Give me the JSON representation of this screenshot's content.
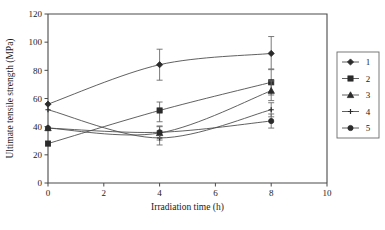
{
  "chart_data": {
    "type": "line",
    "title": "",
    "xlabel": "Irradiation time (h)",
    "ylabel": "Ultimate tensile strength (MPa)",
    "x": [
      0,
      4,
      8
    ],
    "xlim": [
      0,
      10
    ],
    "ylim": [
      0,
      120
    ],
    "xticks": [
      "0",
      "2",
      "4",
      "6",
      "8",
      "10"
    ],
    "xtick_values": [
      0,
      2,
      4,
      6,
      8,
      10
    ],
    "yticks": [
      "0",
      "20",
      "40",
      "60",
      "80",
      "100",
      "120"
    ],
    "ytick_values": [
      0,
      20,
      40,
      60,
      80,
      100,
      120
    ],
    "grid": false,
    "legend_position": "right",
    "series": [
      {
        "name": "1",
        "marker": "diamond",
        "values": [
          56,
          84,
          92
        ],
        "err_low": [
          0,
          11,
          11
        ],
        "err_high": [
          0,
          11,
          12
        ]
      },
      {
        "name": "2",
        "marker": "square",
        "values": [
          28,
          51.5,
          71.5
        ],
        "err_low": [
          0,
          8,
          9
        ],
        "err_high": [
          0,
          6,
          9
        ]
      },
      {
        "name": "3",
        "marker": "triangle",
        "values": [
          39,
          35.5,
          65.5
        ],
        "err_low": [
          0,
          5,
          7
        ],
        "err_high": [
          0,
          5,
          7
        ]
      },
      {
        "name": "4",
        "marker": "cross",
        "values": [
          52,
          32,
          52
        ],
        "err_low": [
          0,
          5,
          5
        ],
        "err_high": [
          0,
          5,
          5
        ]
      },
      {
        "name": "5",
        "marker": "circle",
        "values": [
          39,
          36,
          44
        ],
        "err_low": [
          0,
          4,
          5
        ],
        "err_high": [
          0,
          4,
          5
        ]
      }
    ],
    "colors": {
      "line": "#4f4f4f",
      "marker": "#2b2b2b",
      "axis": "#4a4a4a",
      "error": "#6b6b6b",
      "background": "#ffffff"
    }
  },
  "legend": {
    "entries": [
      {
        "label": "1"
      },
      {
        "label": "2"
      },
      {
        "label": "3"
      },
      {
        "label": "4"
      },
      {
        "label": "5"
      }
    ]
  }
}
